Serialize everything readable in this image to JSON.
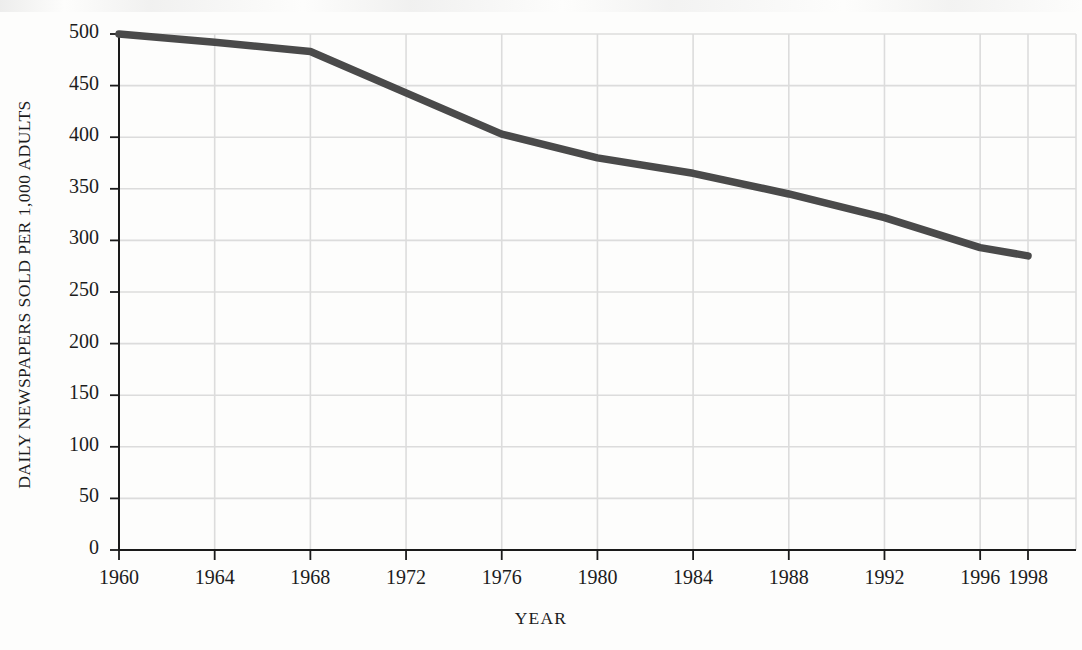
{
  "chart_data": {
    "type": "line",
    "title": "",
    "subtitle": "",
    "xlabel": "YEAR",
    "ylabel": "DAILY NEWSPAPERS SOLD PER 1,000 ADULTS",
    "xlim": [
      1960,
      1998
    ],
    "ylim": [
      0,
      500
    ],
    "grid": true,
    "legend": "none",
    "x_tick_labels": [
      "1960",
      "1964",
      "1968",
      "1972",
      "1976",
      "1980",
      "1984",
      "1988",
      "1992",
      "1996",
      "1998"
    ],
    "x_tick_values": [
      1960,
      1964,
      1968,
      1972,
      1976,
      1980,
      1984,
      1988,
      1992,
      1996,
      1998
    ],
    "y_tick_labels": [
      "0",
      "50",
      "100",
      "150",
      "200",
      "250",
      "300",
      "350",
      "400",
      "450",
      "500"
    ],
    "y_tick_values": [
      0,
      50,
      100,
      150,
      200,
      250,
      300,
      350,
      400,
      450,
      500
    ],
    "series": [
      {
        "name": "Daily newspapers sold per 1,000 adults",
        "color": "#4a4a4a",
        "x": [
          1960,
          1964,
          1968,
          1972,
          1976,
          1980,
          1984,
          1988,
          1992,
          1996,
          1998
        ],
        "values": [
          500,
          492,
          483,
          443,
          403,
          380,
          365,
          345,
          322,
          293,
          285
        ]
      }
    ],
    "annotations": [],
    "colors": {
      "line": "#4a4a4a",
      "grid": "#dcdcdc",
      "axis": "#1a1a1a",
      "text": "#1c1c1c",
      "background": "#fdfdfc"
    }
  }
}
